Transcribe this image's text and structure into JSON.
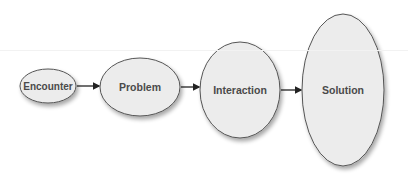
{
  "diagram": {
    "type": "flow",
    "colors": {
      "node_fill": "#ececec",
      "node_stroke": "#555555",
      "text": "#4a4a4a",
      "arrow": "#222222"
    },
    "nodes": [
      {
        "id": "encounter",
        "label": "Encounter",
        "cx": 48,
        "cy": 86,
        "rx": 28,
        "ry": 17,
        "font_size": 10
      },
      {
        "id": "problem",
        "label": "Problem",
        "cx": 140,
        "cy": 87,
        "rx": 40,
        "ry": 29,
        "font_size": 10.5
      },
      {
        "id": "interaction",
        "label": "Interaction",
        "cx": 240,
        "cy": 90,
        "rx": 40,
        "ry": 48,
        "font_size": 10.5
      },
      {
        "id": "solution",
        "label": "Solution",
        "cx": 343,
        "cy": 90,
        "rx": 41,
        "ry": 76,
        "font_size": 10.5
      }
    ],
    "edges": [
      {
        "from": "encounter",
        "to": "problem"
      },
      {
        "from": "problem",
        "to": "interaction"
      },
      {
        "from": "interaction",
        "to": "solution"
      }
    ]
  }
}
